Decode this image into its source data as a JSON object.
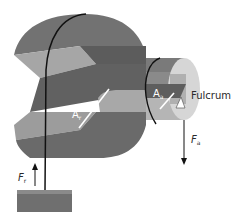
{
  "diagram": {
    "labels": {
      "resistance_arm": {
        "main": "A",
        "sub": "r"
      },
      "applied_arm": {
        "main": "A",
        "sub": "a"
      },
      "fulcrum": "Fulcrum",
      "applied_force": {
        "main": "F",
        "sub": "a"
      },
      "resistance_force": {
        "main": "F",
        "sub": "r"
      }
    },
    "colors": {
      "wheel_top": "#6e6e6e",
      "wheel_light": "#a9a9a9",
      "wheel_dark": "#5a5a5a",
      "axle_light": "#c8c8c8",
      "axle_face": "#d9d9d9",
      "rope": "#111111",
      "load": "#6f6f6f"
    }
  }
}
